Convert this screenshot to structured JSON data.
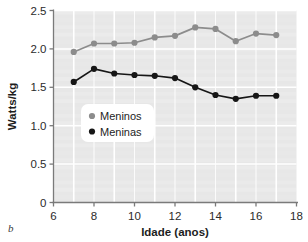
{
  "figure": {
    "panel_label": "b"
  },
  "chart_data": {
    "type": "line",
    "title": "",
    "xlabel": "Idade (anos)",
    "ylabel": "Watts/kg",
    "xlim": [
      6,
      18
    ],
    "ylim": [
      0,
      2.5
    ],
    "xticks": [
      6,
      8,
      10,
      12,
      14,
      16,
      18
    ],
    "xticklabels": [
      "6",
      "8",
      "10",
      "12",
      "14",
      "16",
      "18"
    ],
    "yticks": [
      0,
      0.5,
      1.0,
      1.5,
      2.0,
      2.5
    ],
    "yticklabels": [
      "0",
      "0.5",
      "1.0",
      "1.5",
      "2.0",
      "2.5"
    ],
    "grid": true,
    "grid_color": "#ffffff",
    "plot_bgcolor": "#e7e7e7",
    "legend_position": "center-left",
    "x": [
      7,
      8,
      9,
      10,
      11,
      12,
      13,
      14,
      15,
      16,
      17
    ],
    "series": [
      {
        "name": "Meninos",
        "color": "#8c8c8c",
        "marker": "circle",
        "values": [
          1.96,
          2.07,
          2.07,
          2.08,
          2.15,
          2.17,
          2.28,
          2.26,
          2.1,
          2.2,
          2.18
        ]
      },
      {
        "name": "Meninas",
        "color": "#161616",
        "marker": "circle",
        "values": [
          1.57,
          1.74,
          1.68,
          1.66,
          1.65,
          1.62,
          1.5,
          1.4,
          1.35,
          1.39,
          1.39
        ]
      }
    ]
  }
}
